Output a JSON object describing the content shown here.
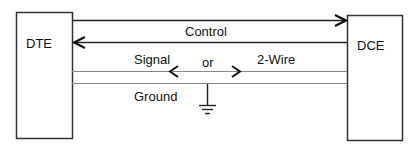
{
  "diagram": {
    "left_box": {
      "label": "DTE"
    },
    "right_box": {
      "label": "DCE"
    },
    "lines": {
      "control_label": "Control",
      "signal_label": "Signal",
      "or_label": "or",
      "two_wire_label": "2-Wire",
      "ground_label": "Ground"
    },
    "colors": {
      "stroke": "#222222",
      "thin_line": "#888888",
      "background": "#ffffff"
    }
  }
}
